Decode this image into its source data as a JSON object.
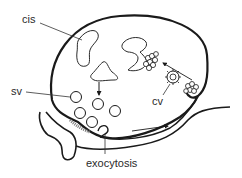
{
  "diagram": {
    "type": "biological-schematic",
    "labels": {
      "cis": "cis",
      "sv": "sv",
      "cv": "cv",
      "exocytosis": "exocytosis"
    },
    "colors": {
      "ink": "#1a1a1a",
      "background": "#ffffff",
      "text": "#2a2a2a"
    }
  }
}
